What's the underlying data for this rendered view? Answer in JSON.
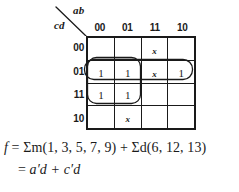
{
  "diagram": {
    "type": "karnaugh-map",
    "axes": {
      "column_variables": "ab",
      "row_variables": "cd",
      "column_labels": [
        "00",
        "01",
        "11",
        "10"
      ],
      "row_labels": [
        "00",
        "01",
        "11",
        "10"
      ]
    },
    "cells": [
      [
        "",
        "",
        "x",
        ""
      ],
      [
        "1",
        "1",
        "x",
        "1"
      ],
      [
        "1",
        "1",
        "",
        ""
      ],
      [
        "",
        "x",
        "",
        ""
      ]
    ],
    "cell_kinds": [
      [
        "empty",
        "empty",
        "dontcare",
        "empty"
      ],
      [
        "one",
        "one",
        "dontcare",
        "one"
      ],
      [
        "one",
        "one",
        "empty",
        "empty"
      ],
      [
        "empty",
        "dontcare",
        "empty",
        "empty"
      ]
    ],
    "groups": [
      {
        "name": "group-row01-full",
        "term": "a'd",
        "cells": "row cd=01, columns ab=00,01,11,10"
      },
      {
        "name": "group-2x2-left",
        "term": "c'd",
        "cells": "rows cd=01,11 and columns ab=00,01"
      }
    ]
  },
  "equations": {
    "line1": {
      "func": "f",
      "eq": "=",
      "sum_m": "Σm(1, 3, 5, 7, 9)",
      "plus": "+",
      "sum_d": "Σd(6, 12, 13)",
      "full": "f = Σm(1, 3, 5, 7, 9) + Σd(6, 12, 13)"
    },
    "line2": {
      "eq": "=",
      "expr": "a′d + c′d",
      "full": "= a′d + c′d"
    }
  },
  "colors": {
    "ink": "#1a1a1a",
    "background": "#ffffff"
  }
}
